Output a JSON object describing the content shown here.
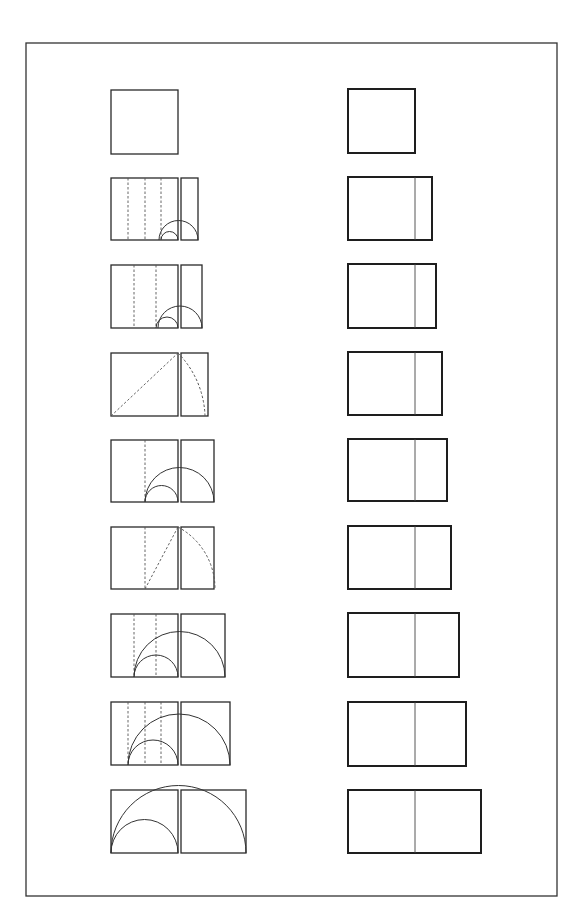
{
  "figure": {
    "frame": {
      "x": 26,
      "y": 43,
      "width": 531,
      "height": 853
    },
    "colors": {
      "background": "#ffffff",
      "stroke": "#2a2a2a"
    },
    "left_column": [
      {
        "row": 1,
        "label": "square",
        "square": [
          111,
          90,
          67,
          64
        ],
        "extension": null,
        "dashed_x": [],
        "arcs": [],
        "diagonal": null
      },
      {
        "row": 2,
        "label": "construction-2",
        "square": [
          111,
          178,
          67,
          62
        ],
        "extension": [
          181,
          178,
          17,
          62
        ],
        "dashed_x": [
          128,
          145,
          161
        ],
        "arcs": [
          {
            "cx": 169.5,
            "r": 8.5,
            "style": "solid"
          },
          {
            "cx": 178.5,
            "r": 19.5,
            "style": "solid"
          }
        ],
        "diagonal": null
      },
      {
        "row": 3,
        "label": "construction-3",
        "square": [
          111,
          265,
          67,
          63
        ],
        "extension": [
          181,
          265,
          21,
          63
        ],
        "dashed_x": [
          134,
          156
        ],
        "arcs": [
          {
            "cx": 167,
            "r": 11,
            "style": "solid"
          },
          {
            "cx": 180,
            "r": 22,
            "style": "solid"
          }
        ],
        "diagonal": null
      },
      {
        "row": 4,
        "label": "construction-diagonal-1",
        "square": [
          111,
          353,
          67,
          63
        ],
        "extension": [
          181,
          353,
          27,
          63
        ],
        "dashed_x": [],
        "arcs": [
          {
            "type": "quarter",
            "cx": 111,
            "cy": 416,
            "r": 94,
            "style": "dashed"
          }
        ],
        "diagonal": {
          "x1": 111,
          "y1": 416,
          "x2": 178,
          "y2": 353
        }
      },
      {
        "row": 5,
        "label": "construction-5",
        "square": [
          111,
          440,
          67,
          62
        ],
        "extension": [
          181,
          440,
          33,
          62
        ],
        "dashed_x": [
          145
        ],
        "arcs": [
          {
            "cx": 161.5,
            "r": 16.5,
            "style": "solid"
          },
          {
            "cx": 179.5,
            "r": 34.5,
            "style": "solid"
          }
        ],
        "diagonal": null
      },
      {
        "row": 6,
        "label": "construction-diagonal-2",
        "square": [
          111,
          527,
          67,
          62
        ],
        "extension": [
          181,
          527,
          33,
          62
        ],
        "dashed_x": [
          145
        ],
        "arcs": [
          {
            "type": "quarter",
            "cx": 145,
            "cy": 589,
            "r": 70,
            "style": "dashed"
          }
        ],
        "diagonal": {
          "x1": 145,
          "y1": 589,
          "x2": 178,
          "y2": 527
        }
      },
      {
        "row": 7,
        "label": "construction-7",
        "square": [
          111,
          614,
          67,
          63
        ],
        "extension": [
          181,
          614,
          44,
          63
        ],
        "dashed_x": [
          134,
          156
        ],
        "arcs": [
          {
            "cx": 156,
            "r": 22,
            "style": "solid"
          },
          {
            "cx": 179.5,
            "r": 45.5,
            "style": "solid"
          }
        ],
        "diagonal": null
      },
      {
        "row": 8,
        "label": "construction-8",
        "square": [
          111,
          702,
          67,
          63
        ],
        "extension": [
          181,
          702,
          49,
          63
        ],
        "dashed_x": [
          128,
          145,
          161
        ],
        "arcs": [
          {
            "cx": 153,
            "r": 25,
            "style": "solid"
          },
          {
            "cx": 179,
            "r": 51,
            "style": "solid"
          }
        ],
        "diagonal": null
      },
      {
        "row": 9,
        "label": "construction-9",
        "square": [
          111,
          790,
          67,
          63
        ],
        "extension": [
          181,
          790,
          65,
          63
        ],
        "dashed_x": [],
        "arcs": [
          {
            "cx": 144.5,
            "r": 33.5,
            "style": "solid"
          },
          {
            "cx": 178.5,
            "r": 67.5,
            "style": "solid"
          }
        ],
        "diagonal": null
      }
    ],
    "right_column": [
      {
        "row": 1,
        "rect": [
          348,
          89,
          67,
          64
        ],
        "divider_x": null
      },
      {
        "row": 2,
        "rect": [
          348,
          177,
          84,
          63
        ],
        "divider_x": 415
      },
      {
        "row": 3,
        "rect": [
          348,
          264,
          88,
          64
        ],
        "divider_x": 415
      },
      {
        "row": 4,
        "rect": [
          348,
          352,
          94,
          63
        ],
        "divider_x": 415
      },
      {
        "row": 5,
        "rect": [
          348,
          439,
          99,
          62
        ],
        "divider_x": 415
      },
      {
        "row": 6,
        "rect": [
          348,
          526,
          103,
          63
        ],
        "divider_x": 415
      },
      {
        "row": 7,
        "rect": [
          348,
          613,
          111,
          64
        ],
        "divider_x": 415
      },
      {
        "row": 8,
        "rect": [
          348,
          702,
          118,
          64
        ],
        "divider_x": 415
      },
      {
        "row": 9,
        "rect": [
          348,
          790,
          133,
          63
        ],
        "divider_x": 415
      }
    ]
  }
}
